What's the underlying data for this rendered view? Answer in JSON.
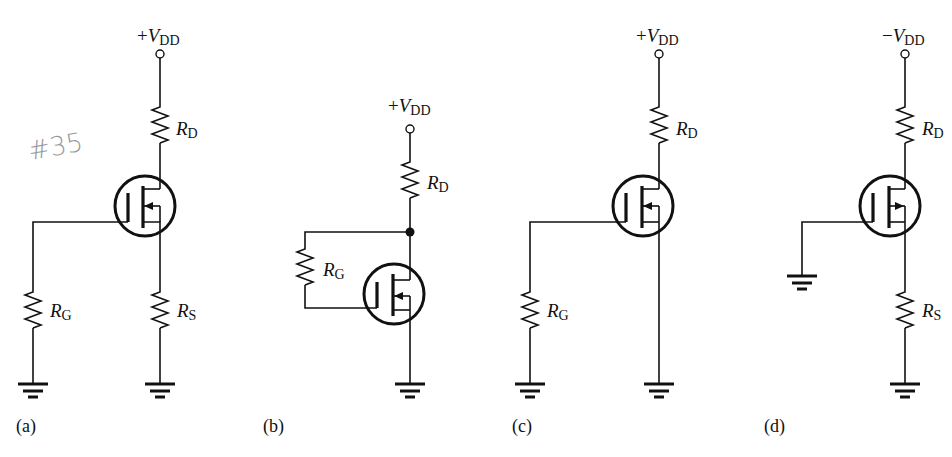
{
  "annotation": {
    "handwritten_note": "#35"
  },
  "circuits": [
    {
      "id": "a",
      "caption": "(a)",
      "supply": {
        "sign": "+",
        "symbol": "V",
        "subscript": "DD"
      },
      "resistors": [
        {
          "symbol": "R",
          "subscript": "D"
        },
        {
          "symbol": "R",
          "subscript": "G"
        },
        {
          "symbol": "R",
          "subscript": "S"
        }
      ],
      "transistor": "n-channel enhancement MOSFET"
    },
    {
      "id": "b",
      "caption": "(b)",
      "supply": {
        "sign": "+",
        "symbol": "V",
        "subscript": "DD"
      },
      "resistors": [
        {
          "symbol": "R",
          "subscript": "D"
        },
        {
          "symbol": "R",
          "subscript": "G"
        }
      ],
      "transistor": "n-channel enhancement MOSFET"
    },
    {
      "id": "c",
      "caption": "(c)",
      "supply": {
        "sign": "+",
        "symbol": "V",
        "subscript": "DD"
      },
      "resistors": [
        {
          "symbol": "R",
          "subscript": "D"
        },
        {
          "symbol": "R",
          "subscript": "G"
        }
      ],
      "transistor": "n-channel enhancement MOSFET"
    },
    {
      "id": "d",
      "caption": "(d)",
      "supply": {
        "sign": "−",
        "symbol": "V",
        "subscript": "DD"
      },
      "resistors": [
        {
          "symbol": "R",
          "subscript": "D"
        },
        {
          "symbol": "R",
          "subscript": "S"
        }
      ],
      "transistor": "p-channel enhancement MOSFET"
    }
  ]
}
